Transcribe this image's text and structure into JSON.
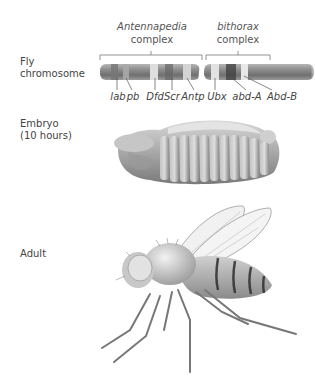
{
  "rows": {
    "chromosome": {
      "label_line1": "Fly",
      "label_line2": "chromosome"
    },
    "embryo": {
      "label_line1": "Embryo",
      "label_line2": "(10 hours)"
    },
    "adult": {
      "label": "Adult"
    }
  },
  "complexes": [
    {
      "name": "Antennapedia",
      "suffix": "complex"
    },
    {
      "name": "bithorax",
      "suffix": "complex"
    }
  ],
  "genes": [
    {
      "name": "lab",
      "x": 118
    },
    {
      "name": "pb",
      "x": 133
    },
    {
      "name": "Dfd",
      "x": 155
    },
    {
      "name": "Scr",
      "x": 172
    },
    {
      "name": "Antp",
      "x": 192
    },
    {
      "name": "Ubx",
      "x": 217
    },
    {
      "name": "abd-A",
      "x": 247
    },
    {
      "name": "Abd-B",
      "x": 281
    }
  ],
  "colors": {
    "chromosome": "#8a8a8a",
    "band_light": "#e6e6e6",
    "band_dark": "#5a5a5a",
    "text": "#444444"
  }
}
